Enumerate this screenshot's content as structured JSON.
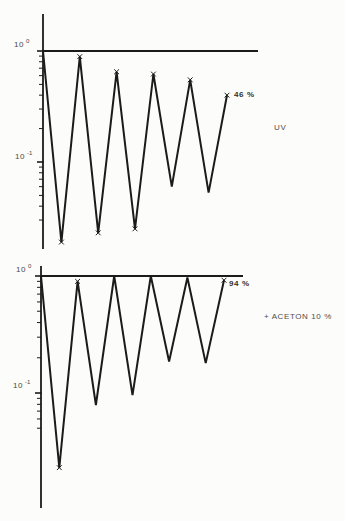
{
  "figure": {
    "background": "#fcfcfa",
    "line_color": "#1b1b1b",
    "text_color": "#3f3f3f"
  },
  "chart_data": [
    {
      "type": "line",
      "name": "uv-fatigue-curve",
      "annotation": "UV",
      "end_label": "46 %",
      "yscale": "log",
      "ylim": [
        0.015,
        1.3
      ],
      "grid": false,
      "yticks": [
        {
          "base": "10",
          "exp": "0",
          "value": 1
        },
        {
          "base": "10",
          "exp": "-1",
          "value": 0.1
        }
      ],
      "points": [
        {
          "x": 0,
          "v": 1.0,
          "m": false
        },
        {
          "x": 0.5,
          "v": 0.019,
          "m": true
        },
        {
          "x": 1,
          "v": 0.89,
          "m": true
        },
        {
          "x": 1.5,
          "v": 0.023,
          "m": true
        },
        {
          "x": 2,
          "v": 0.65,
          "m": true
        },
        {
          "x": 2.5,
          "v": 0.025,
          "m": true
        },
        {
          "x": 3,
          "v": 0.62,
          "m": true
        },
        {
          "x": 3.5,
          "v": 0.06,
          "m": false
        },
        {
          "x": 4,
          "v": 0.55,
          "m": true
        },
        {
          "x": 4.5,
          "v": 0.053,
          "m": false
        },
        {
          "x": 5,
          "v": 0.4,
          "m": true
        }
      ]
    },
    {
      "type": "line",
      "name": "aceton-fatigue-curve",
      "annotation": "+ ACETON 10 %",
      "end_label": "94 %",
      "yscale": "log",
      "ylim": [
        0.01,
        1.3
      ],
      "grid": false,
      "yticks": [
        {
          "base": "10",
          "exp": "0",
          "value": 1
        },
        {
          "base": "10",
          "exp": "-1",
          "value": 0.1
        }
      ],
      "points": [
        {
          "x": 0,
          "v": 1.0,
          "m": false
        },
        {
          "x": 0.5,
          "v": 0.023,
          "m": true
        },
        {
          "x": 1,
          "v": 0.9,
          "m": true
        },
        {
          "x": 1.5,
          "v": 0.079,
          "m": false
        },
        {
          "x": 2,
          "v": 1.0,
          "m": false
        },
        {
          "x": 2.5,
          "v": 0.096,
          "m": false
        },
        {
          "x": 3,
          "v": 1.0,
          "m": false
        },
        {
          "x": 3.5,
          "v": 0.186,
          "m": false
        },
        {
          "x": 4,
          "v": 0.97,
          "m": false
        },
        {
          "x": 4.5,
          "v": 0.18,
          "m": false
        },
        {
          "x": 5,
          "v": 0.92,
          "m": true
        }
      ]
    }
  ]
}
